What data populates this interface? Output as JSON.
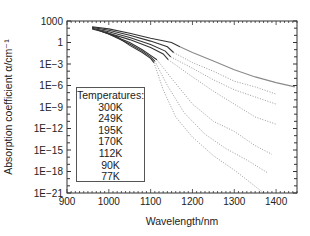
{
  "chart_data": {
    "type": "line",
    "title": "",
    "xlabel": "Wavelength/nm",
    "ylabel": "Absorption coefficient α/cm⁻¹",
    "xlim": [
      900,
      1450
    ],
    "ylim_log10": [
      -21,
      3
    ],
    "yscale": "log",
    "x_ticks": [
      900,
      1000,
      1100,
      1200,
      1300,
      1400
    ],
    "y_ticks": [
      "1000",
      "1",
      "1E−3",
      "1E−6",
      "1E−9",
      "1E−12",
      "1E−15",
      "1E−18",
      "1E−21"
    ],
    "grid": false,
    "legend": {
      "title": "Temperatures:",
      "entries": [
        "300K",
        "249K",
        "195K",
        "170K",
        "112K",
        "90K",
        "77K"
      ],
      "position": "inside lower-left"
    },
    "series": [
      {
        "name": "300K",
        "measured": [
          [
            960,
            2.2
          ],
          [
            1000,
            1.9
          ],
          [
            1050,
            1.3
          ],
          [
            1100,
            0.6
          ],
          [
            1150,
            0.0
          ],
          [
            1170,
            -0.6
          ]
        ],
        "extrapolated": [
          [
            1170,
            -0.6
          ],
          [
            1200,
            -1.4
          ],
          [
            1250,
            -2.6
          ],
          [
            1300,
            -3.8
          ],
          [
            1350,
            -4.8
          ],
          [
            1400,
            -5.6
          ],
          [
            1445,
            -6.2
          ]
        ],
        "extrapolated_style": "solid-gray"
      },
      {
        "name": "249K",
        "measured": [
          [
            960,
            2.1
          ],
          [
            1000,
            1.7
          ],
          [
            1050,
            1.0
          ],
          [
            1100,
            0.2
          ],
          [
            1140,
            -0.6
          ],
          [
            1155,
            -1.4
          ]
        ],
        "extrapolated": [
          [
            1155,
            -1.4
          ],
          [
            1200,
            -2.8
          ],
          [
            1250,
            -4.0
          ],
          [
            1300,
            -5.4
          ],
          [
            1350,
            -6.2
          ],
          [
            1400,
            -7.2
          ]
        ]
      },
      {
        "name": "195K",
        "measured": [
          [
            960,
            2.0
          ],
          [
            1000,
            1.5
          ],
          [
            1050,
            0.7
          ],
          [
            1100,
            -0.3
          ],
          [
            1135,
            -1.2
          ],
          [
            1148,
            -2.0
          ]
        ],
        "extrapolated": [
          [
            1148,
            -2.0
          ],
          [
            1200,
            -3.6
          ],
          [
            1250,
            -5.2
          ],
          [
            1300,
            -6.6
          ],
          [
            1350,
            -7.6
          ],
          [
            1400,
            -8.6
          ]
        ]
      },
      {
        "name": "170K",
        "measured": [
          [
            960,
            1.9
          ],
          [
            1000,
            1.3
          ],
          [
            1050,
            0.4
          ],
          [
            1100,
            -0.7
          ],
          [
            1130,
            -1.6
          ],
          [
            1142,
            -2.4
          ]
        ],
        "extrapolated": [
          [
            1142,
            -2.4
          ],
          [
            1200,
            -4.8
          ],
          [
            1250,
            -6.8
          ],
          [
            1300,
            -8.6
          ],
          [
            1350,
            -10.4
          ],
          [
            1400,
            -11.4
          ]
        ]
      },
      {
        "name": "112K",
        "measured": [
          [
            970,
            1.8
          ],
          [
            1000,
            1.2
          ],
          [
            1050,
            0.0
          ],
          [
            1080,
            -1.0
          ],
          [
            1100,
            -1.8
          ],
          [
            1115,
            -2.4
          ]
        ],
        "extrapolated": [
          [
            1115,
            -2.4
          ],
          [
            1150,
            -5.0
          ],
          [
            1200,
            -8.6
          ],
          [
            1250,
            -11.0
          ],
          [
            1300,
            -12.4
          ],
          [
            1350,
            -14.4
          ],
          [
            1390,
            -15.6
          ]
        ]
      },
      {
        "name": "90K",
        "measured": [
          [
            980,
            1.6
          ],
          [
            1000,
            1.2
          ],
          [
            1050,
            -0.2
          ],
          [
            1080,
            -1.2
          ],
          [
            1100,
            -2.0
          ],
          [
            1110,
            -2.6
          ]
        ],
        "extrapolated": [
          [
            1110,
            -2.6
          ],
          [
            1140,
            -6.0
          ],
          [
            1180,
            -9.8
          ],
          [
            1230,
            -12.8
          ],
          [
            1280,
            -14.8
          ],
          [
            1330,
            -16.4
          ],
          [
            1380,
            -18.2
          ]
        ]
      },
      {
        "name": "77K",
        "measured": [
          [
            990,
            1.5
          ],
          [
            1020,
            0.8
          ],
          [
            1050,
            -0.4
          ],
          [
            1080,
            -1.4
          ],
          [
            1100,
            -2.2
          ],
          [
            1108,
            -2.8
          ]
        ],
        "extrapolated": [
          [
            1108,
            -2.8
          ],
          [
            1130,
            -6.6
          ],
          [
            1160,
            -10.4
          ],
          [
            1200,
            -13.2
          ],
          [
            1250,
            -15.8
          ],
          [
            1300,
            -17.8
          ],
          [
            1340,
            -19.6
          ],
          [
            1370,
            -21.0
          ]
        ]
      }
    ]
  },
  "colors": {
    "measured": "#333333",
    "extrapolated_dotted": "#9a9a9a",
    "extrapolated_300K": "#8a8a8a",
    "axis": "#333333"
  }
}
